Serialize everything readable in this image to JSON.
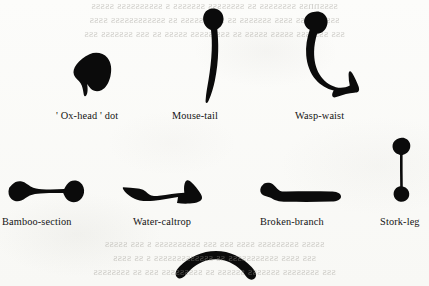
{
  "figure": {
    "kind": "scanned-book-plate",
    "background_color": "#fbfbf9",
    "ink_color": "#0b0b0b",
    "label_color": "#141414"
  },
  "bleed_through": {
    "note": "mirrored show-through text from the reverse of the leaf; illegible",
    "top_lines": [
      "ssssnnss  ssssssss  ss  ssssssss  sssssss  s  ssssssssss  sssss",
      "ssssss  sss  ssss  sssssss  ss  ssss  sssss  ss  ssssssssssss  ssss",
      "sss  sssssss  sssss  sssss  ss  sss  sssss   sssss  ss  sss  sssssss  sss"
    ],
    "bottom_lines": [
      "sssss  sssssssss  ssss  sss  sss  ssssssssss  s   sss  sssss",
      "sss   ssss  sssssssssss  ss  sssssssssssss  s  ss    ssss",
      "sss  ssssssss  sssssss  ssssss  ss  sssssssss  sss  ss  ssssssss"
    ]
  },
  "strokes": [
    {
      "id": "oxhead",
      "label": "' Ox-head ' dot",
      "icon": "ox-head-dot-stroke",
      "row": 1,
      "description": "heavy irregular blob dot with a blunt tail at lower left"
    },
    {
      "id": "mousetail",
      "label": "Mouse-tail",
      "icon": "mouse-tail-stroke",
      "row": 1,
      "description": "knotted head tapering into a long thin whip-like tail"
    },
    {
      "id": "waspwaist",
      "label": "Wasp-waist",
      "icon": "wasp-waist-stroke",
      "row": 1,
      "description": "hook with a bulbous head, pinched waist and flared foot"
    },
    {
      "id": "bamboo",
      "label": "Bamboo-section",
      "icon": "bamboo-section-stroke",
      "row": 2,
      "description": "horizontal bar swollen at both ends and thin at the middle"
    },
    {
      "id": "caltrop",
      "label": "Water-caltrop",
      "icon": "water-caltrop-stroke",
      "row": 2,
      "description": "angular horizontal stroke, pointed left end, notched right end"
    },
    {
      "id": "broken",
      "label": "Broken-branch",
      "icon": "broken-branch-stroke",
      "row": 2,
      "description": "horizontal bar with a stepped break notch near the left end"
    },
    {
      "id": "storkleg",
      "label": "Stork-leg",
      "icon": "stork-leg-stroke",
      "row": 2,
      "description": "vertical stroke with knobs at head and foot, thin shaft"
    },
    {
      "id": "arc",
      "label": "",
      "icon": "arched-bridge-stroke",
      "row": 3,
      "description": "unlabelled downward-opening arc, thick and evenly weighted"
    }
  ]
}
